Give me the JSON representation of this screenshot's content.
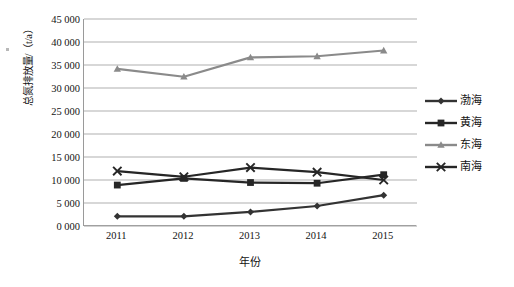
{
  "chart_data": {
    "type": "line",
    "title": "",
    "xlabel": "年份",
    "ylabel": "总氮排放量/（t/a）",
    "categories": [
      "2011",
      "2012",
      "2013",
      "2014",
      "2015"
    ],
    "ylim": [
      0,
      45000
    ],
    "ytick_step": 5000,
    "ytick_labels": [
      "45 000",
      "40 000",
      "35 000",
      "30 000",
      "25 000",
      "20 000",
      "15 000",
      "10 000",
      "5 000",
      "0 000"
    ],
    "ytick_values": [
      45000,
      40000,
      35000,
      30000,
      25000,
      20000,
      15000,
      10000,
      5000,
      0
    ],
    "grid": true,
    "grid_axis": "y",
    "legend_position": "right",
    "series": [
      {
        "name": "渤海",
        "marker": "diamond",
        "color": "#333333",
        "values": [
          2100,
          2100,
          3050,
          4350,
          6700
        ]
      },
      {
        "name": "黄海",
        "marker": "square",
        "color": "#262626",
        "values": [
          8900,
          10350,
          9450,
          9300,
          11150
        ]
      },
      {
        "name": "东海",
        "marker": "triangle",
        "color": "#8a8a8a",
        "values": [
          34150,
          32450,
          36650,
          36900,
          38150
        ]
      },
      {
        "name": "南海",
        "marker": "cross",
        "color": "#262626",
        "values": [
          11950,
          10700,
          12700,
          11700,
          10000
        ]
      }
    ]
  },
  "legend": {
    "items": [
      {
        "label": "渤海",
        "marker": "diamond-marker-icon",
        "color": "#333333"
      },
      {
        "label": "黄海",
        "marker": "square-marker-icon",
        "color": "#262626"
      },
      {
        "label": "东海",
        "marker": "triangle-marker-icon",
        "color": "#8a8a8a"
      },
      {
        "label": "南海",
        "marker": "cross-marker-icon",
        "color": "#262626"
      }
    ]
  },
  "axes": {
    "x_title": "年份",
    "y_title": "总氮排放量/（t/a）"
  },
  "colors": {
    "grid": "#a6a6a6",
    "axis": "#9a9a9a",
    "background": "#ffffff",
    "text": "#141414"
  }
}
